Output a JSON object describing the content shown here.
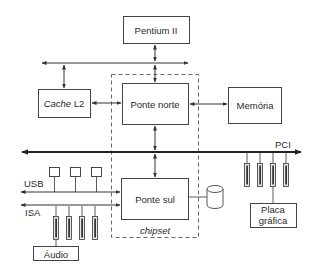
{
  "diagram": {
    "type": "computer-architecture-block-diagram",
    "nodes": {
      "cpu": {
        "label": "Pentium II"
      },
      "cache": {
        "label_italic": "Cache",
        "label_rest": " L2"
      },
      "north_bridge": {
        "label": "Ponte norte"
      },
      "memory": {
        "label": "Memória"
      },
      "south_bridge": {
        "label": "Ponte sul"
      },
      "graphics": {
        "label_line1": "Placa",
        "label_line2": "gráfica"
      },
      "audio": {
        "label": "Áudio"
      },
      "disk": {
        "label": ""
      }
    },
    "buses": {
      "pci": {
        "label": "PCI"
      },
      "usb": {
        "label": "USB"
      },
      "isa": {
        "label": "ISA"
      },
      "cpu_bus": {
        "label": ""
      }
    },
    "groups": {
      "chipset": {
        "label": "chipset"
      }
    },
    "edges": [
      {
        "from": "cpu",
        "to": "cpu_bus",
        "style": "bidirectional"
      },
      {
        "from": "cpu_bus",
        "to": "north_bridge",
        "style": "bidirectional"
      },
      {
        "from": "cache",
        "to": "cpu_bus",
        "style": "bidirectional"
      },
      {
        "from": "cache",
        "to": "north_bridge",
        "style": "bidirectional"
      },
      {
        "from": "north_bridge",
        "to": "memory",
        "style": "bidirectional"
      },
      {
        "from": "north_bridge",
        "to": "pci",
        "style": "bidirectional"
      },
      {
        "from": "pci",
        "to": "south_bridge",
        "style": "bidirectional"
      },
      {
        "from": "usb",
        "to": "south_bridge",
        "style": "bidirectional"
      },
      {
        "from": "isa",
        "to": "south_bridge",
        "style": "bidirectional"
      },
      {
        "from": "south_bridge",
        "to": "disk",
        "style": "line"
      },
      {
        "from": "pci",
        "to": "graphics",
        "style": "slot"
      },
      {
        "from": "isa",
        "to": "audio",
        "style": "slot"
      }
    ],
    "usb_devices": 3,
    "pci_slots": 4,
    "isa_slots": 4
  },
  "colors": {
    "line": "#333333",
    "box_border": "#444444",
    "slot_fill": "#e8e8e8",
    "background": "#ffffff"
  }
}
